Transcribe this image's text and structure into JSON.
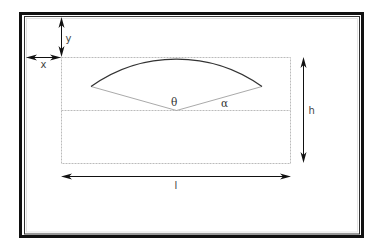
{
  "diagram": {
    "type": "geometry-schematic",
    "labels": {
      "x_offset": "x",
      "y_offset": "y",
      "height": "h",
      "length": "l",
      "center_angle": "θ",
      "edge_angle": "α"
    },
    "colors": {
      "frame": "#111111",
      "frame_inner": "#333333",
      "arc": "#333333",
      "radius_lines": "#aaaaaa",
      "dashed_box": "#bbbbbb",
      "arrows": "#111111",
      "label_text": "#444444"
    }
  }
}
